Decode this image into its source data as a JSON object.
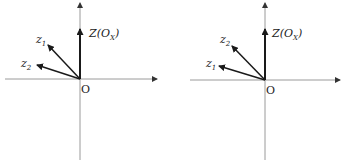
{
  "diagrams": [
    {
      "id": "left",
      "origin_label": "O",
      "z_label": "Z(O",
      "z_label_sub": "X",
      "z_label_close": ")",
      "vectors": [
        {
          "name": "z",
          "sub": "1",
          "note": "upper vector"
        },
        {
          "name": "z",
          "sub": "2",
          "note": "lower vector"
        }
      ]
    },
    {
      "id": "right",
      "origin_label": "O",
      "z_label": "Z(O",
      "z_label_sub": "X",
      "z_label_close": ")",
      "vectors": [
        {
          "name": "z",
          "sub": "2",
          "note": "upper vector"
        },
        {
          "name": "z",
          "sub": "1",
          "note": "lower vector"
        }
      ]
    }
  ],
  "colors": {
    "axis": "#9a9a9a",
    "vector": "#1a1a1a",
    "text": "#222222"
  }
}
